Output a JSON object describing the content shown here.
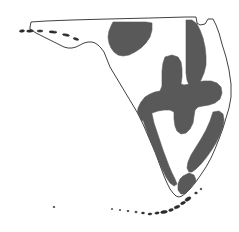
{
  "figure": {
    "type": "distribution-range-map",
    "region": "Florida",
    "title": "",
    "background_color": "#ffffff",
    "outline_color": "#2b2b2b",
    "outline_width_px": 0.9,
    "shade_color": "#595959",
    "width_px": 239,
    "height_px": 232
  },
  "legend": {
    "present": false,
    "entries": [
      {
        "label": "",
        "color": "#595959",
        "meaning": "shaded range area"
      },
      {
        "label": "",
        "color": "#ffffff",
        "meaning": "unshaded area"
      }
    ]
  },
  "labels": {
    "visible_text": []
  },
  "geometry": {
    "state_outline": "M 30 27 L 31 22 L 46 21 L 72 20 L 108 19 L 150 18 L 186 17 L 196 17 L 197 23 L 200 25 L 205 24 L 208 19 L 213 19 L 216 25 L 219 33 L 222 44 L 226 57 L 229 70 L 231 84 L 231 97 L 229 108 L 226 118 L 223 128 L 219 139 L 215 149 L 211 158 L 206 167 L 200 176 L 195 183 L 190 189 L 186 193 L 182 196 L 179 197 L 176 196 L 173 193 L 170 189 L 167 183 L 164 176 L 161 168 L 158 160 L 155 152 L 152 145 L 149 138 L 146 131 L 143 124 L 140 118 L 137 112 L 134 107 L 131 102 L 128 97 L 125 92 L 122 87 L 119 82 L 116 77 L 113 72 L 110 67 L 108 62 L 106 57 L 104 52 L 101 48 L 98 45 L 95 43 L 92 42 L 88 42 L 84 43 L 80 45 L 76 47 L 72 48 L 68 48 L 64 47 L 60 45 L 56 43 L 52 41 L 48 39 L 44 37 L 40 35 L 36 33 L 33 31 L 30 29 Z",
    "outline_detail_coast": "M 17 29 L 21 27 L 26 26 L 30 27",
    "shade_regions": [
      {
        "name": "north-central-blob",
        "path": "M 113 22 L 124 22 L 136 22 L 146 22 L 152 23 L 152 30 L 150 37 L 146 43 L 141 48 L 135 52 L 129 55 L 123 56 L 118 55 L 114 52 L 111 48 L 109 43 L 108 37 L 109 31 L 111 26 Z"
      },
      {
        "name": "northeast-atlantic-coastal-strip",
        "path": "M 186 20 L 192 20 L 197 24 L 200 30 L 203 38 L 205 47 L 206 56 L 206 65 L 204 73 L 201 80 L 198 85 L 195 88 L 192 88 L 189 85 L 187 80 L 186 73 L 186 64 L 186 54 L 186 44 L 186 33 Z"
      },
      {
        "name": "central-peninsula-mass",
        "path": "M 165 57 L 172 55 L 178 57 L 181 62 L 182 69 L 182 77 L 181 84 L 184 85 L 190 84 L 197 82 L 204 81 L 211 81 L 217 83 L 221 87 L 222 93 L 220 99 L 215 103 L 209 105 L 203 106 L 198 107 L 195 110 L 194 116 L 193 123 L 190 129 L 186 133 L 181 134 L 177 131 L 175 126 L 174 119 L 174 112 L 170 110 L 164 110 L 158 111 L 152 113 L 147 116 L 143 120 L 140 124 L 138 121 L 137 115 L 138 108 L 141 102 L 145 97 L 150 94 L 155 92 L 160 91 L 162 86 L 162 79 L 162 71 L 163 63 Z"
      },
      {
        "name": "southwest-gulf-coastal-strip",
        "path": "M 140 104 L 146 103 L 150 107 L 152 114 L 154 123 L 157 132 L 160 141 L 163 150 L 166 158 L 169 166 L 172 173 L 175 179 L 177 184 L 174 186 L 170 183 L 166 177 L 162 169 L 158 160 L 154 151 L 150 141 L 147 132 L 144 123 L 141 114 Z"
      },
      {
        "name": "southeast-coastal-region",
        "path": "M 213 112 L 219 111 L 223 114 L 224 120 L 223 127 L 220 135 L 216 143 L 211 151 L 206 158 L 201 164 L 196 169 L 192 172 L 189 172 L 187 168 L 188 162 L 191 155 L 196 147 L 201 139 L 206 130 L 210 121 Z"
      },
      {
        "name": "south-tip-shade",
        "path": "M 183 176 L 189 173 L 194 175 L 196 180 L 195 186 L 191 191 L 186 194 L 181 194 L 178 190 L 178 184 L 180 179 Z"
      }
    ],
    "florida_keys": [
      {
        "cx": 188,
        "cy": 199,
        "rx": 3.2,
        "ry": 1.6,
        "rot": -30
      },
      {
        "cx": 183,
        "cy": 203,
        "rx": 2.6,
        "ry": 1.3,
        "rot": -25
      },
      {
        "cx": 177,
        "cy": 207,
        "rx": 3.0,
        "ry": 1.4,
        "rot": -20
      },
      {
        "cx": 171,
        "cy": 210,
        "rx": 2.4,
        "ry": 1.2,
        "rot": -15
      },
      {
        "cx": 164,
        "cy": 212,
        "rx": 3.4,
        "ry": 1.4,
        "rot": -10
      },
      {
        "cx": 157,
        "cy": 213,
        "rx": 2.2,
        "ry": 1.1,
        "rot": -6
      },
      {
        "cx": 150,
        "cy": 214,
        "rx": 2.0,
        "ry": 1.0,
        "rot": -4
      },
      {
        "cx": 143,
        "cy": 213,
        "rx": 1.6,
        "ry": 0.9,
        "rot": 0
      },
      {
        "cx": 136,
        "cy": 212,
        "rx": 1.3,
        "ry": 0.8,
        "rot": 0
      },
      {
        "cx": 128,
        "cy": 211,
        "rx": 1.1,
        "ry": 0.7,
        "rot": 0
      },
      {
        "cx": 120,
        "cy": 210,
        "rx": 0.9,
        "ry": 0.6,
        "rot": 0
      },
      {
        "cx": 112,
        "cy": 209,
        "rx": 0.8,
        "ry": 0.6,
        "rot": 0
      },
      {
        "cx": 54,
        "cy": 207,
        "rx": 0.9,
        "ry": 0.7,
        "rot": 0
      },
      {
        "cx": 196,
        "cy": 193,
        "rx": 1.4,
        "ry": 1.0,
        "rot": 0
      },
      {
        "cx": 201,
        "cy": 189,
        "rx": 1.0,
        "ry": 0.8,
        "rot": 0
      }
    ],
    "gulf_barrier_islands": [
      {
        "cx": 22,
        "cy": 31,
        "rx": 2.6,
        "ry": 1.2,
        "rot": -8
      },
      {
        "cx": 30,
        "cy": 31,
        "rx": 3.4,
        "ry": 1.2,
        "rot": -4
      },
      {
        "cx": 40,
        "cy": 31,
        "rx": 3.0,
        "ry": 1.1,
        "rot": 0
      },
      {
        "cx": 53,
        "cy": 32,
        "rx": 4.0,
        "ry": 1.1,
        "rot": 4
      },
      {
        "cx": 66,
        "cy": 35,
        "rx": 3.6,
        "ry": 1.1,
        "rot": 10
      },
      {
        "cx": 76,
        "cy": 39,
        "rx": 2.8,
        "ry": 1.1,
        "rot": 16
      }
    ]
  }
}
